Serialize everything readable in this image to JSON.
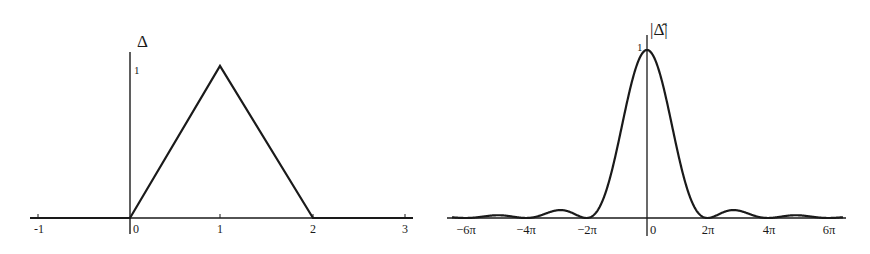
{
  "chart_data": [
    {
      "type": "line",
      "title": "",
      "ylabel": "Δ",
      "xlabel": "",
      "xlim": [
        -1.1,
        3.05
      ],
      "ylim": [
        0,
        1
      ],
      "x_ticks": [
        "-1",
        "0",
        "1",
        "2",
        "3"
      ],
      "y_ticks": [
        "1"
      ],
      "series": [
        {
          "name": "Δ",
          "x": [
            -1.1,
            0,
            1,
            2,
            3.05
          ],
          "y": [
            0,
            0,
            1,
            0,
            0
          ]
        }
      ],
      "grid": false,
      "legend": null
    },
    {
      "type": "line",
      "title": "",
      "ylabel": "|Δ̂|",
      "xlabel": "",
      "xlim": [
        "-6.6π",
        "6.6π"
      ],
      "ylim": [
        0,
        1
      ],
      "x_ticks": [
        "−6π",
        "−4π",
        "−2π",
        "0",
        "2π",
        "4π",
        "6π"
      ],
      "y_ticks": [
        "1"
      ],
      "series": [
        {
          "name": "|Δ̂|",
          "formula": "(sin(ξ/2)/(ξ/2))^2",
          "x": [
            "−6π",
            "−5π",
            "−4π",
            "−3π",
            "−2π",
            "−π",
            "0",
            "π",
            "2π",
            "3π",
            "4π",
            "5π",
            "6π"
          ],
          "y": [
            0,
            0.016,
            0,
            0.045,
            0,
            0.405,
            1,
            0.405,
            0,
            0.045,
            0,
            0.016,
            0
          ]
        }
      ],
      "grid": false,
      "legend": null
    }
  ],
  "left": {
    "ylabel": "Δ",
    "ytick": "1",
    "xticks": [
      "-1",
      "0",
      "1",
      "2",
      "3"
    ]
  },
  "right": {
    "ylabel": "|Δ̂|",
    "ytick": "1",
    "xticks": [
      "−6π",
      "−4π",
      "−2π",
      "0",
      "2π",
      "4π",
      "6π"
    ]
  }
}
